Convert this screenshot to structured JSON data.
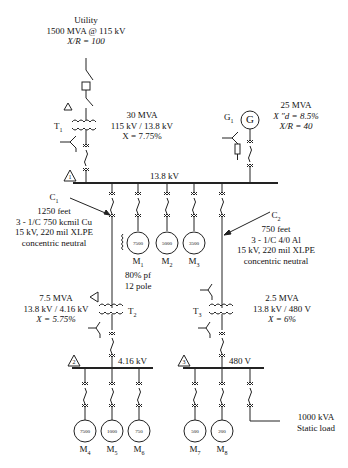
{
  "utility": {
    "line1": "Utility",
    "line2": "1500 MVA @ 115 kV",
    "line3": "X/R = 100"
  },
  "t1": {
    "tag": "T",
    "sub": "1",
    "rating": "30 MVA",
    "voltage": "115 kV / 13.8 kV",
    "impedance": "X = 7.75%"
  },
  "g1": {
    "tag": "G",
    "sub": "1",
    "symbol": "G",
    "rating": "25 MVA",
    "xd": "X ″d = 8.5%",
    "xr": "X/R = 40"
  },
  "bus1": {
    "label": "13.8 kV",
    "marker": "1"
  },
  "c1": {
    "tag": "C",
    "sub": "1",
    "length": "1250 feet",
    "conductor": "3 - 1/C 750 kcmil Cu",
    "insulation": "15 kV, 220 mil XLPE",
    "neutral": "concentric neutral"
  },
  "c2": {
    "tag": "C",
    "sub": "2",
    "length": "750 feet",
    "conductor": "3 - 1/C 4/0 Al",
    "insulation": "15 kV, 220 mil XLPE",
    "neutral": "concentric neutral"
  },
  "m1": {
    "tag": "M",
    "sub": "1",
    "hp": "7500",
    "pf": "80% pf",
    "poles": "12 pole"
  },
  "m2": {
    "tag": "M",
    "sub": "2",
    "hp": "5000"
  },
  "m3": {
    "tag": "M",
    "sub": "3",
    "hp": "3500"
  },
  "t2": {
    "tag": "T",
    "sub": "2",
    "rating": "7.5 MVA",
    "voltage": "13.8 kV / 4.16 kV",
    "impedance": "X = 5.75%"
  },
  "t3": {
    "tag": "T",
    "sub": "3",
    "rating": "2.5 MVA",
    "voltage": "13.8 kV / 480 V",
    "impedance": "X = 6%"
  },
  "bus2": {
    "label": "4.16 kV",
    "marker": "2"
  },
  "bus3": {
    "label": "480 V",
    "marker": "3"
  },
  "m4": {
    "tag": "M",
    "sub": "4",
    "hp": "7500"
  },
  "m5": {
    "tag": "M",
    "sub": "5",
    "hp": "1000"
  },
  "m6": {
    "tag": "M",
    "sub": "6",
    "hp": "750"
  },
  "m7": {
    "tag": "M",
    "sub": "7",
    "hp": "500"
  },
  "m8": {
    "tag": "M",
    "sub": "8",
    "hp": "200"
  },
  "static_load": {
    "line1": "1000 kVA",
    "line2": "Static load"
  }
}
